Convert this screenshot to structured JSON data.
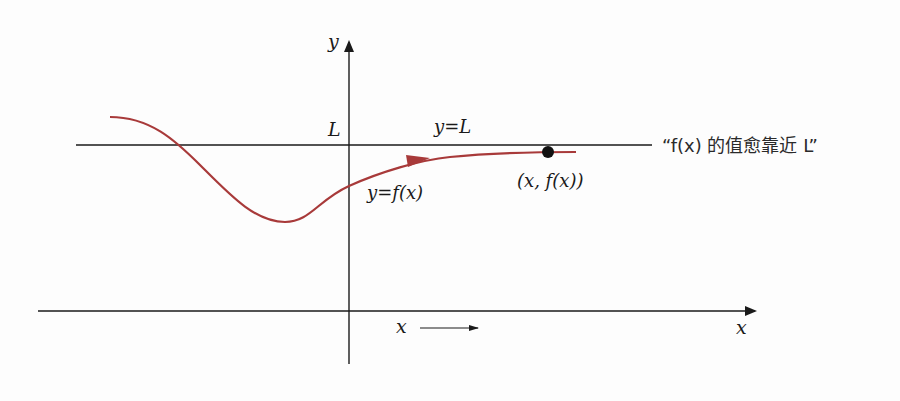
{
  "diagram": {
    "type": "limit-at-infinity",
    "axes": {
      "x_label": "x",
      "y_label": "y"
    },
    "asymptote": {
      "label_left": "L",
      "label_line": "y=L"
    },
    "curve": {
      "label": "y=f(x)",
      "color": "#a83a3a"
    },
    "point": {
      "label": "(x, f(x))"
    },
    "direction_hint": {
      "label": "x"
    },
    "annotation": {
      "text": "“f(x) 的值愈靠近 L”"
    },
    "colors": {
      "axis": "#1a1a1a",
      "curve": "#a83a3a",
      "point": "#111111"
    }
  }
}
